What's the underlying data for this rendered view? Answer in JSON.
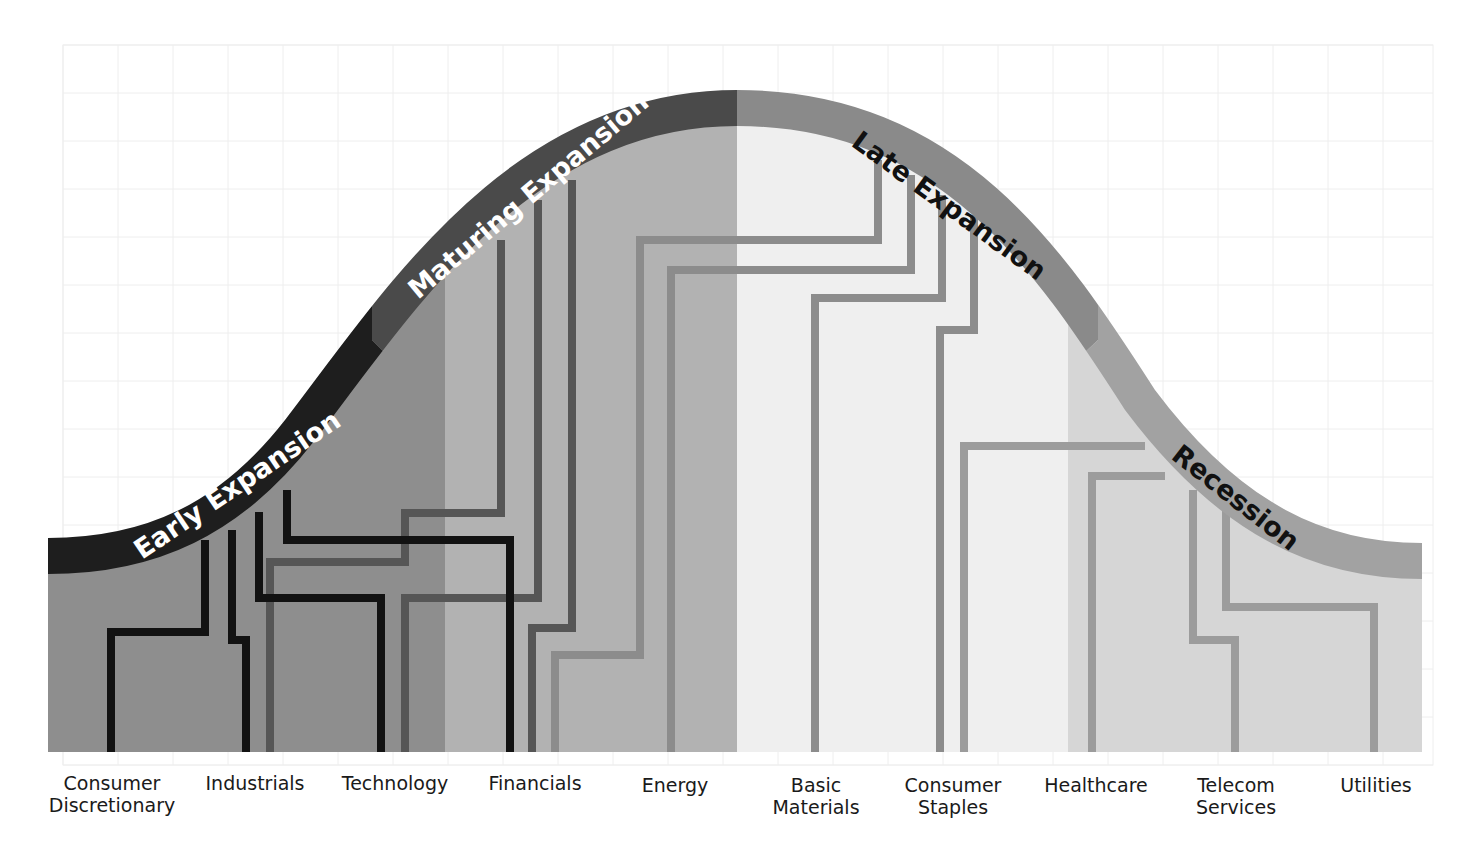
{
  "diagram": {
    "title": "",
    "type": "sector-rotation business cycle",
    "phases": [
      {
        "label": "Early Expansion",
        "band_color": "#1e1e1e",
        "fill_color": "#8e8e8e",
        "text_color": "#ffffff",
        "line_color": "#121212"
      },
      {
        "label": "Maturing Expansion",
        "band_color": "#4a4a4a",
        "fill_color": "#b2b2b2",
        "text_color": "#ffffff",
        "line_color": "#565656"
      },
      {
        "label": "Late Expansion",
        "band_color": "#8a8a8a",
        "fill_color": "#efefef",
        "text_color": "#111111",
        "line_color": "#8c8c8c"
      },
      {
        "label": "Recession",
        "band_color": "#a2a2a2",
        "fill_color": "#d6d6d6",
        "text_color": "#111111",
        "line_color": "#9c9c9c"
      }
    ],
    "sectors": [
      {
        "label_line1": "Consumer",
        "label_line2": "Discretionary",
        "phase": "Early Expansion"
      },
      {
        "label_line1": "Industrials",
        "label_line2": "",
        "phase": "Early Expansion"
      },
      {
        "label_line1": "Technology",
        "label_line2": "",
        "phase": "Early Expansion / Maturing Expansion"
      },
      {
        "label_line1": "Financials",
        "label_line2": "",
        "phase": "Early Expansion / Maturing Expansion"
      },
      {
        "label_line1": "Energy",
        "label_line2": "",
        "phase": "Late Expansion"
      },
      {
        "label_line1": "Basic",
        "label_line2": "Materials",
        "phase": "Late Expansion"
      },
      {
        "label_line1": "Consumer",
        "label_line2": "Staples",
        "phase": "Late Expansion / Recession"
      },
      {
        "label_line1": "Healthcare",
        "label_line2": "",
        "phase": "Recession"
      },
      {
        "label_line1": "Telecom",
        "label_line2": "Services",
        "phase": "Recession"
      },
      {
        "label_line1": "Utilities",
        "label_line2": "",
        "phase": "Recession"
      }
    ],
    "grid": {
      "visible": true,
      "color": "#eeeeee"
    }
  }
}
